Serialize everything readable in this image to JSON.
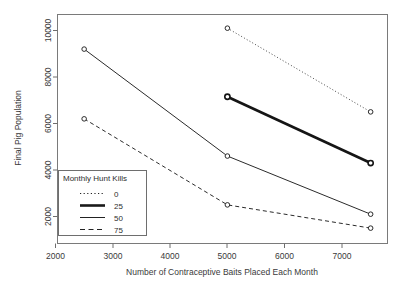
{
  "chart_data": {
    "type": "line",
    "title": "",
    "xlabel": "Number of Contraceptive Baits Placed Each Month",
    "ylabel": "Final Pig Population",
    "xlim": [
      1700,
      7900
    ],
    "ylim": [
      900,
      10700
    ],
    "xticks": [
      2000,
      3000,
      4000,
      5000,
      6000,
      7000
    ],
    "xtick_labels": [
      "2000",
      "3000",
      "4000",
      "5000",
      "6000",
      "7000"
    ],
    "yticks": [
      2000,
      4000,
      6000,
      8000,
      10000
    ],
    "ytick_labels": [
      "2000",
      "4000",
      "6000",
      "8000",
      "10000"
    ],
    "grid": false,
    "legend_position": "bottom-left",
    "legend_title": "Monthly Hunt Kills",
    "series": [
      {
        "name": "0",
        "label": "0",
        "style": "dotted",
        "x": [
          5000,
          7500
        ],
        "values": [
          10100,
          6500
        ]
      },
      {
        "name": "25",
        "label": "25",
        "style": "thick-solid",
        "x": [
          5000,
          7500
        ],
        "values": [
          7150,
          4300
        ]
      },
      {
        "name": "50",
        "label": "50",
        "style": "solid",
        "x": [
          2500,
          5000,
          7500
        ],
        "values": [
          9200,
          4600,
          2100
        ]
      },
      {
        "name": "75",
        "label": "75",
        "style": "dashed",
        "x": [
          2500,
          5000,
          7500
        ],
        "values": [
          6200,
          2500,
          1500
        ]
      }
    ]
  },
  "axis": {
    "x_title": "Number of Contraceptive Baits Placed Each Month",
    "y_title": "Final Pig Population"
  },
  "legend": {
    "title": "Monthly Hunt Kills",
    "entries": [
      {
        "label": "0",
        "style": "dotted"
      },
      {
        "label": "25",
        "style": "thick-solid"
      },
      {
        "label": "50",
        "style": "solid"
      },
      {
        "label": "75",
        "style": "dashed"
      }
    ]
  }
}
